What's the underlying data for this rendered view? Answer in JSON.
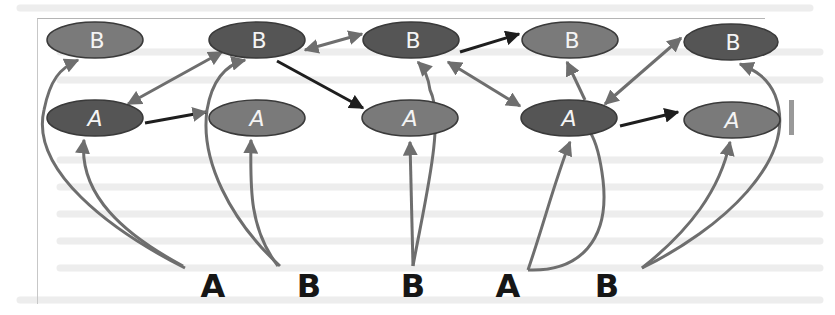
{
  "diagram": {
    "type": "state-transition-graph",
    "colors": {
      "node_dark": "#555555",
      "node_light": "#7a7a7a",
      "node_stroke": "#3a3a3a",
      "edge_gray": "#6e6e6e",
      "edge_black": "#1e1e1e",
      "label_text": "#f4f4f4",
      "sequence_text": "#161616"
    },
    "columns": [
      {
        "b": {
          "id": "B1",
          "label": "B",
          "shade": "light"
        },
        "a": {
          "id": "A1",
          "label": "A",
          "shade": "dark"
        }
      },
      {
        "b": {
          "id": "B2",
          "label": "B",
          "shade": "dark"
        },
        "a": {
          "id": "A2",
          "label": "A",
          "shade": "light"
        }
      },
      {
        "b": {
          "id": "B3",
          "label": "B",
          "shade": "dark"
        },
        "a": {
          "id": "A3",
          "label": "A",
          "shade": "light"
        }
      },
      {
        "b": {
          "id": "B4",
          "label": "B",
          "shade": "light"
        },
        "a": {
          "id": "A4",
          "label": "A",
          "shade": "dark"
        }
      },
      {
        "b": {
          "id": "B5",
          "label": "B",
          "shade": "dark"
        },
        "a": {
          "id": "A5",
          "label": "A",
          "shade": "light"
        }
      }
    ],
    "edges": [
      {
        "from": "A1",
        "to": "B2",
        "style": "bidirectional-gray"
      },
      {
        "from": "A1",
        "to": "A2",
        "style": "black"
      },
      {
        "from": "B2",
        "to": "B3",
        "style": "bidirectional-gray"
      },
      {
        "from": "B2",
        "to": "A3",
        "style": "black"
      },
      {
        "from": "B3",
        "to": "B4",
        "style": "black"
      },
      {
        "from": "B3",
        "to": "A4",
        "style": "bidirectional-gray"
      },
      {
        "from": "A4",
        "to": "B4",
        "style": "gray"
      },
      {
        "from": "A4",
        "to": "B5",
        "style": "bidirectional-gray"
      },
      {
        "from": "A4",
        "to": "A5",
        "style": "black"
      }
    ],
    "input_sequence": [
      "A",
      "B",
      "B",
      "A",
      "B"
    ],
    "input_edges": [
      {
        "from_symbol": 0,
        "to": [
          "B1",
          "A1"
        ]
      },
      {
        "from_symbol": 1,
        "to": [
          "B2",
          "A2"
        ]
      },
      {
        "from_symbol": 2,
        "to": [
          "B3",
          "A3"
        ]
      },
      {
        "from_symbol": 3,
        "to": [
          "A4",
          "B4"
        ]
      },
      {
        "from_symbol": 4,
        "to": [
          "A5",
          "B5"
        ]
      }
    ]
  }
}
